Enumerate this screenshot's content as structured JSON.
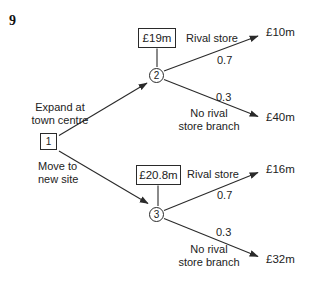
{
  "question_number": "9",
  "colors": {
    "ink": "#222222",
    "background": "#ffffff"
  },
  "tree": {
    "root": {
      "id": "1",
      "type": "decision"
    },
    "decision_branches": [
      {
        "label_line1": "Expand at",
        "label_line2": "town centre",
        "to_node": "2"
      },
      {
        "label_line1": "Move to",
        "label_line2": "new site",
        "to_node": "3"
      }
    ],
    "chance_nodes": [
      {
        "id": "2",
        "expected_value": "£19m",
        "outcomes": [
          {
            "label": "Rival store",
            "probability": "0.7",
            "payoff": "£10m"
          },
          {
            "label_line1": "No rival",
            "label_line2": "store branch",
            "probability": "0.3",
            "payoff": "£40m"
          }
        ]
      },
      {
        "id": "3",
        "expected_value": "£20.8m",
        "outcomes": [
          {
            "label": "Rival store",
            "probability": "0.7",
            "payoff": "£16m"
          },
          {
            "label_line1": "No rival",
            "label_line2": "store branch",
            "probability": "0.3",
            "payoff": "£32m"
          }
        ]
      }
    ]
  }
}
